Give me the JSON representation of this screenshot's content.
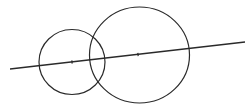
{
  "diagram": {
    "width": 246,
    "height": 106,
    "background": "#ffffff",
    "stroke_color": "#2a2a2a",
    "line": {
      "x1": 10,
      "y1": 69,
      "x2": 245,
      "y2": 42,
      "stroke_width": 1.3
    },
    "circles": [
      {
        "id": "small",
        "cx": 72,
        "cy": 62,
        "rx": 33,
        "ry": 32.5,
        "stroke_width": 1.2
      },
      {
        "id": "large",
        "cx": 139.5,
        "cy": 55,
        "rx": 50,
        "ry": 48,
        "stroke_width": 1.2
      }
    ],
    "center_marks": [
      {
        "x": 72,
        "y": 62
      },
      {
        "x": 138,
        "y": 54.5
      }
    ]
  }
}
